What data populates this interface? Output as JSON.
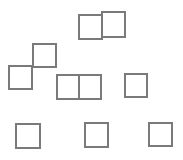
{
  "diagram": {
    "background": "#ffffff",
    "stroke_color": "#7a7a7a",
    "stroke_width": 2,
    "squares": [
      {
        "id": "top-pair-left",
        "x": 78,
        "y": 14,
        "w": 25,
        "h": 26
      },
      {
        "id": "top-pair-right",
        "x": 101,
        "y": 11,
        "w": 25,
        "h": 27
      },
      {
        "id": "step-upper",
        "x": 32,
        "y": 43,
        "w": 25,
        "h": 25
      },
      {
        "id": "step-lower",
        "x": 8,
        "y": 65,
        "w": 25,
        "h": 25
      },
      {
        "id": "mid-pair-left",
        "x": 56,
        "y": 74,
        "w": 24,
        "h": 26
      },
      {
        "id": "mid-pair-right",
        "x": 78,
        "y": 74,
        "w": 24,
        "h": 26
      },
      {
        "id": "mid-right",
        "x": 124,
        "y": 73,
        "w": 24,
        "h": 25
      },
      {
        "id": "bottom-left",
        "x": 15,
        "y": 123,
        "w": 26,
        "h": 26
      },
      {
        "id": "bottom-middle",
        "x": 84,
        "y": 122,
        "w": 25,
        "h": 26
      },
      {
        "id": "bottom-right",
        "x": 148,
        "y": 122,
        "w": 25,
        "h": 25
      }
    ]
  }
}
